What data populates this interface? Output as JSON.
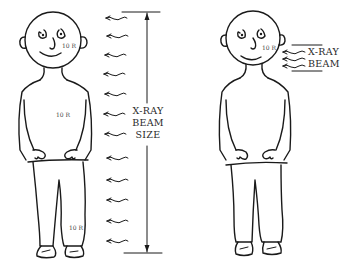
{
  "diagram": {
    "ink_color": "#1a1a1a",
    "background": "#ffffff",
    "left_panel": {
      "figure": "standing person, whole body exposed",
      "dose_labels": {
        "head": "10 R",
        "torso": "10 R",
        "leg": "10 R"
      },
      "beam_label_lines": [
        "X-RAY",
        "BEAM",
        "SIZE"
      ],
      "arrow_count": 12
    },
    "right_panel": {
      "figure": "standing person, only head exposed",
      "dose_labels": {
        "head": "10 R"
      },
      "beam_label_lines": [
        "X-RAY",
        "BEAM"
      ],
      "arrow_count": 3
    }
  }
}
